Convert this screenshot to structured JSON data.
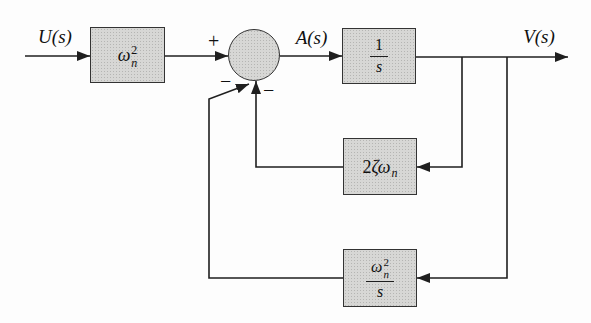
{
  "diagram": {
    "signals": {
      "input": "U(s)",
      "intermediate": "A(s)",
      "output": "V(s)"
    },
    "summing_junction": {
      "plus": "+",
      "minus_position": "−",
      "minus_velocity": "−"
    },
    "blocks": {
      "gain": {
        "letter": "ω",
        "sub": "n",
        "sup": "2"
      },
      "integrator": {
        "num": "1",
        "den": "s"
      },
      "velocity_feedback": {
        "coefficient": "2",
        "letters": "ζω",
        "sub": "n"
      },
      "position_feedback": {
        "letter": "ω",
        "sub": "n",
        "sup": "2",
        "den": "s"
      }
    },
    "colors": {
      "block_fill": "#d7d7d5",
      "block_border": "#333333",
      "line": "#1f1f1f",
      "background": "#fdfdfd"
    }
  }
}
